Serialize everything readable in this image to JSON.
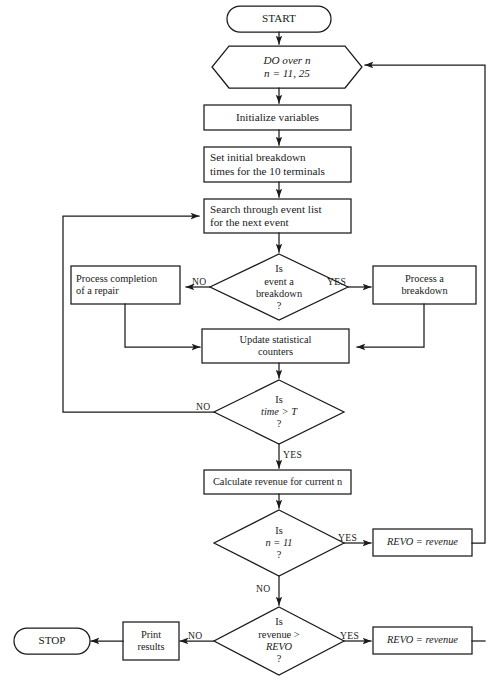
{
  "diagram": {
    "stroke_color": "#1a1a1a",
    "background_color": "#ffffff",
    "width": 499,
    "height": 692
  },
  "nodes": {
    "start": {
      "label": "START",
      "shape": "terminator"
    },
    "do_loop": {
      "line1": "DO over n",
      "line2": "n  =  11, 25",
      "shape": "hexagon"
    },
    "init": {
      "label": "Initialize variables",
      "shape": "process"
    },
    "set_breakdown": {
      "line1": "Set initial breakdown",
      "line2": "times for the 10  terminals",
      "shape": "process"
    },
    "search": {
      "line1": "Search through event list",
      "line2": "for the next event",
      "shape": "process"
    },
    "is_breakdown": {
      "line1": "Is",
      "line2": "event a",
      "line3": "breakdown",
      "line4": "?",
      "shape": "decision"
    },
    "process_completion": {
      "line1": "Process completion",
      "line2": "of a repair",
      "shape": "process"
    },
    "process_breakdown": {
      "line1": "Process a",
      "line2": "breakdown",
      "shape": "process"
    },
    "update_counters": {
      "line1": "Update statistical",
      "line2": "counters",
      "shape": "process"
    },
    "is_time_gt_t": {
      "line1": "Is",
      "line2": "time  >  T",
      "line3": "?",
      "shape": "decision"
    },
    "calc_revenue": {
      "label": "Calculate revenue for current n",
      "shape": "process"
    },
    "is_n_eq_11": {
      "line1": "Is",
      "line2": "n  =  11",
      "line3": "?",
      "shape": "decision"
    },
    "revo_assign_1": {
      "label": "REVO  =   revenue",
      "shape": "process"
    },
    "is_rev_gt_revo": {
      "line1": "Is",
      "line2": "revenue  >",
      "line3": "REVO",
      "line4": "?",
      "shape": "decision"
    },
    "revo_assign_2": {
      "label": "REVO  =   revenue",
      "shape": "process"
    },
    "print_results": {
      "line1": "Print",
      "line2": "results",
      "shape": "process"
    },
    "stop": {
      "label": "STOP",
      "shape": "terminator"
    }
  },
  "edge_labels": {
    "breakdown_no": "NO",
    "breakdown_yes": "YES",
    "time_no": "NO",
    "time_yes": "YES",
    "n11_yes": "YES",
    "n11_no": "NO",
    "rev_yes": "YES",
    "rev_no": "NO"
  }
}
